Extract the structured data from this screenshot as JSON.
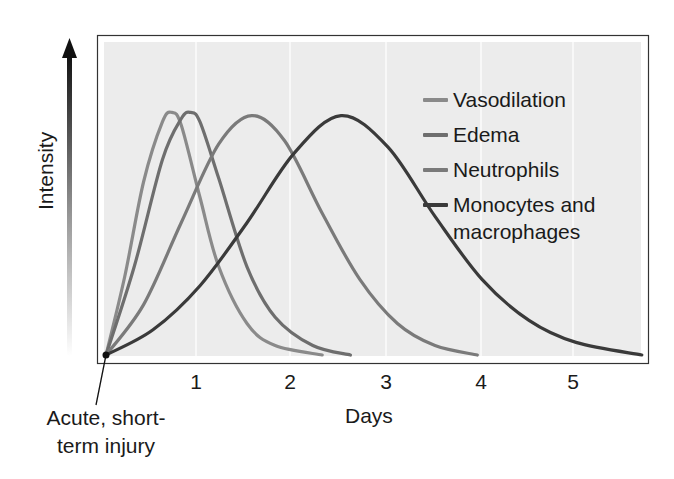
{
  "chart_data": {
    "type": "line",
    "title": "",
    "xlabel": "Days",
    "ylabel": "Intensity",
    "xlim": [
      0,
      5.7
    ],
    "ylim": [
      0,
      1
    ],
    "x_ticks": [
      "1",
      "2",
      "3",
      "4",
      "5"
    ],
    "grid": "faint vertical gridlines at each day",
    "legend_position": "upper right inside plot",
    "annotation": "Acute, short-term injury",
    "series": [
      {
        "name": "Vasodilation",
        "color": "#8a8a8a",
        "peak_day": 0.7,
        "peak_intensity": 0.77,
        "end_day": 2.3,
        "x": [
          0,
          0.2,
          0.4,
          0.6,
          0.7,
          0.8,
          1.0,
          1.2,
          1.5,
          1.8,
          2.3
        ],
        "y": [
          0,
          0.25,
          0.55,
          0.74,
          0.77,
          0.73,
          0.5,
          0.28,
          0.1,
          0.03,
          0
        ]
      },
      {
        "name": "Edema",
        "color": "#6e6e6e",
        "peak_day": 0.9,
        "peak_intensity": 0.77,
        "end_day": 2.6,
        "x": [
          0,
          0.3,
          0.6,
          0.8,
          0.9,
          1.0,
          1.2,
          1.5,
          1.8,
          2.2,
          2.6
        ],
        "y": [
          0,
          0.28,
          0.62,
          0.75,
          0.77,
          0.74,
          0.56,
          0.28,
          0.12,
          0.03,
          0
        ]
      },
      {
        "name": "Neutrophils",
        "color": "#7a7a7a",
        "peak_day": 1.55,
        "peak_intensity": 0.76,
        "end_day": 3.95,
        "x": [
          0,
          0.4,
          0.8,
          1.2,
          1.55,
          1.9,
          2.3,
          2.7,
          3.1,
          3.5,
          3.95
        ],
        "y": [
          0,
          0.16,
          0.42,
          0.67,
          0.76,
          0.68,
          0.45,
          0.24,
          0.1,
          0.03,
          0
        ]
      },
      {
        "name": "Monocytes and macrophages",
        "color": "#3a3a3a",
        "peak_day": 2.5,
        "peak_intensity": 0.76,
        "end_day": 5.7,
        "x": [
          0,
          0.5,
          1.0,
          1.5,
          2.0,
          2.5,
          3.0,
          3.5,
          4.0,
          4.5,
          5.0,
          5.7
        ],
        "y": [
          0,
          0.08,
          0.22,
          0.42,
          0.64,
          0.76,
          0.66,
          0.44,
          0.24,
          0.11,
          0.04,
          0
        ]
      }
    ]
  },
  "legend": [
    {
      "label": "Vasodilation",
      "color": "#8a8a8a"
    },
    {
      "label": "Edema",
      "color": "#6e6e6e"
    },
    {
      "label": "Neutrophils",
      "color": "#7a7a7a"
    },
    {
      "label": "Monocytes and",
      "label2": "macrophages",
      "color": "#3a3a3a"
    }
  ],
  "axes": {
    "x_ticks": [
      "1",
      "2",
      "3",
      "4",
      "5"
    ],
    "xlabel": "Days",
    "ylabel": "Intensity"
  },
  "annotation": {
    "line1": "Acute, short-",
    "line2": "term injury"
  }
}
